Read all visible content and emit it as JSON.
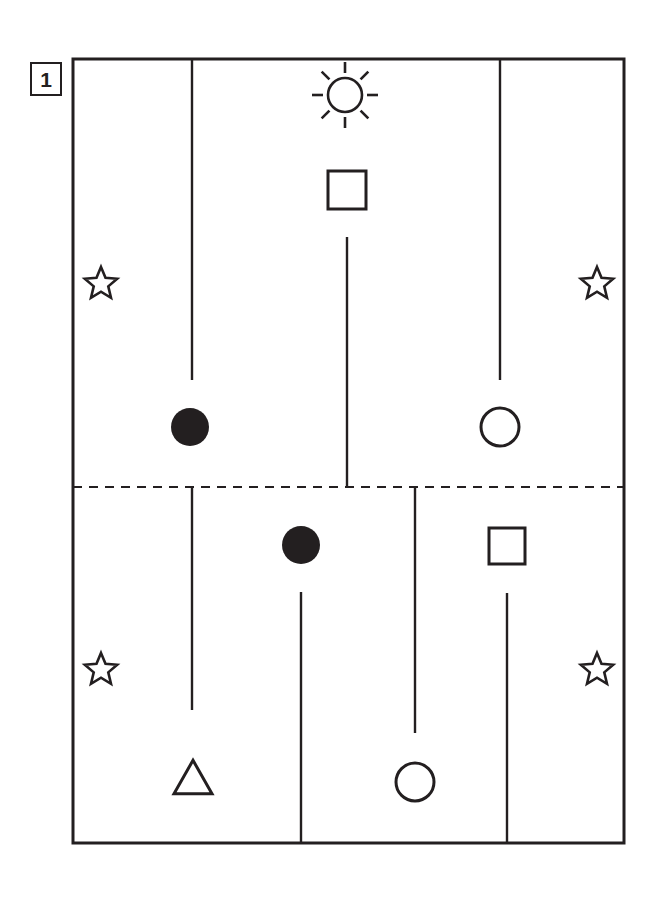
{
  "figure": {
    "panel_label": "1",
    "stroke_color": "#231f20",
    "fill_color": "#231f20",
    "background_color": "#ffffff",
    "width": 661,
    "height": 902
  },
  "frame": {
    "x": 73,
    "y": 59,
    "width": 551,
    "height": 784,
    "stroke_width": 3
  },
  "divider": {
    "name": "dashed-midline",
    "y": 487,
    "x1": 73,
    "x2": 624,
    "dash": "9 7",
    "stroke_width": 2
  },
  "vertical_lines": [
    {
      "name": "line-top-left",
      "x": 192,
      "y1": 59,
      "y2": 380
    },
    {
      "name": "line-top-center",
      "x": 347,
      "y1": 237,
      "y2": 487
    },
    {
      "name": "line-top-right",
      "x": 500,
      "y1": 59,
      "y2": 380
    },
    {
      "name": "line-bottom-left",
      "x": 192,
      "y1": 487,
      "y2": 710
    },
    {
      "name": "line-bottom-center",
      "x": 301,
      "y1": 592,
      "y2": 843
    },
    {
      "name": "line-bottom-midright",
      "x": 415,
      "y1": 487,
      "y2": 733
    },
    {
      "name": "line-bottom-right",
      "x": 507,
      "y1": 593,
      "y2": 843
    }
  ],
  "shapes": [
    {
      "name": "sun-icon",
      "type": "sun",
      "cx": 345,
      "cy": 95,
      "r": 17,
      "ray_inner": 22,
      "ray_outer": 33
    },
    {
      "name": "square-top-center",
      "type": "square-open",
      "cx": 347,
      "cy": 190,
      "size": 38
    },
    {
      "name": "star-top-left",
      "type": "star-open",
      "cx": 101,
      "cy": 284,
      "r": 17
    },
    {
      "name": "star-top-right",
      "type": "star-open",
      "cx": 597,
      "cy": 284,
      "r": 17
    },
    {
      "name": "circle-filled-top-left",
      "type": "circle-filled",
      "cx": 190,
      "cy": 427,
      "r": 19
    },
    {
      "name": "circle-open-top-right",
      "type": "circle-open",
      "cx": 500,
      "cy": 427,
      "r": 19
    },
    {
      "name": "circle-filled-bottom-center",
      "type": "circle-filled",
      "cx": 301,
      "cy": 545,
      "r": 19
    },
    {
      "name": "square-bottom-right",
      "type": "square-open",
      "cx": 507,
      "cy": 546,
      "size": 36
    },
    {
      "name": "star-bottom-left",
      "type": "star-open",
      "cx": 101,
      "cy": 670,
      "r": 17
    },
    {
      "name": "star-bottom-right",
      "type": "star-open",
      "cx": 597,
      "cy": 670,
      "r": 17
    },
    {
      "name": "triangle-bottom-left",
      "type": "triangle-open",
      "cx": 193,
      "cy": 777,
      "size": 38
    },
    {
      "name": "circle-open-bottom-center",
      "type": "circle-open",
      "cx": 415,
      "cy": 782,
      "r": 19
    }
  ]
}
